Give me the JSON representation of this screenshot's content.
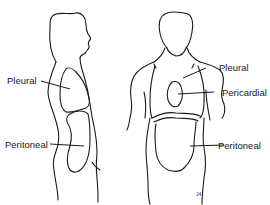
{
  "diagram": {
    "type": "anatomical",
    "colors": {
      "line": "#1a1a1a",
      "background": "#ffffff"
    },
    "figures": [
      {
        "view": "side",
        "labels": [
          {
            "text": "Pleural"
          },
          {
            "text": "Peritoneal"
          }
        ]
      },
      {
        "view": "front",
        "labels": [
          {
            "text": "Pleural"
          },
          {
            "text": "Pericardial"
          },
          {
            "text": "Peritoneal"
          }
        ]
      }
    ],
    "signature": "J4"
  }
}
